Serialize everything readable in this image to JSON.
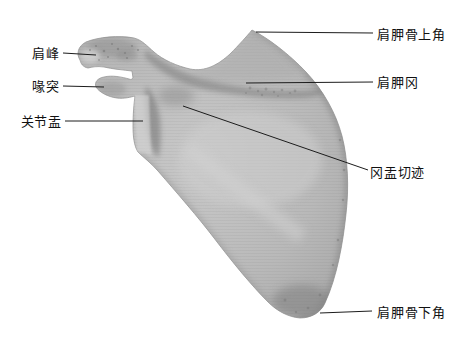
{
  "figure": {
    "background_color": "#ffffff",
    "leader_line_color": "#1c1c1c",
    "label_text_color": "#111111",
    "bone": {
      "base_color": "#c9c9c9",
      "mid_color": "#b9b9b9",
      "edge_color": "#a3a3a3",
      "shadow_color": "#868686",
      "outline_color": "#989898"
    }
  },
  "labels": [
    {
      "name": "acromion",
      "text": "肩峰",
      "side": "left",
      "text_x": 60,
      "text_y": 53,
      "line": [
        63,
        53,
        96,
        55
      ]
    },
    {
      "name": "coracoid-process",
      "text": "喙突",
      "side": "left",
      "text_x": 60,
      "text_y": 86,
      "line": [
        63,
        86,
        104,
        87
      ]
    },
    {
      "name": "glenoid-cavity",
      "text": "关节盂",
      "side": "left",
      "text_x": 62,
      "text_y": 121,
      "line": [
        65,
        121,
        143,
        121
      ]
    },
    {
      "name": "superior-angle",
      "text": "肩胛骨上角",
      "side": "right",
      "text_x": 377,
      "text_y": 34,
      "line": [
        373,
        33,
        256,
        32
      ]
    },
    {
      "name": "spine-of-scapula",
      "text": "肩胛冈",
      "side": "right",
      "text_x": 377,
      "text_y": 82,
      "line": [
        373,
        82,
        246,
        83
      ]
    },
    {
      "name": "spinoglenoid-notch",
      "text": "冈盂切迹",
      "side": "right",
      "text_x": 370,
      "text_y": 172,
      "line": [
        368,
        170,
        183,
        106
      ]
    },
    {
      "name": "inferior-angle",
      "text": "肩胛骨下角",
      "side": "right",
      "text_x": 377,
      "text_y": 312,
      "line": [
        372,
        311,
        320,
        313
      ]
    }
  ]
}
